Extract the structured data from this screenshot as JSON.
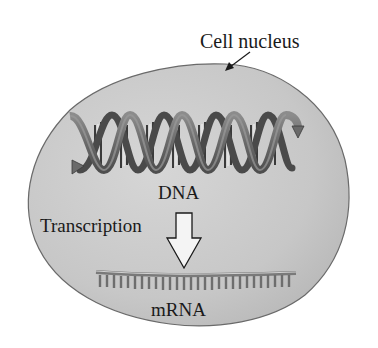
{
  "figure": {
    "type": "biology-diagram",
    "labels": {
      "nucleus": "Cell nucleus",
      "dna": "DNA",
      "process": "Transcription",
      "product": "mRNA"
    },
    "elements": [
      {
        "name": "cell-nucleus",
        "shape": "irregular oval",
        "fill": "#c9c9c9"
      },
      {
        "name": "dna-double-helix",
        "shape": "twisted ribbon with base-pair rungs",
        "color": "#6f6f6f"
      },
      {
        "name": "transcription-arrow",
        "shape": "hollow down arrow",
        "fill": "#f2f2f2"
      },
      {
        "name": "mrna-strand",
        "shape": "single strand with comb of bases",
        "color": "#8a8a8a"
      }
    ],
    "colors": {
      "nucleus_fill": "#c9c9c9",
      "nucleus_stroke": "#6a6a6a",
      "ribbon": "#707070",
      "ribbon_dark": "#4a4a4a",
      "text": "#1a1a1a"
    }
  }
}
